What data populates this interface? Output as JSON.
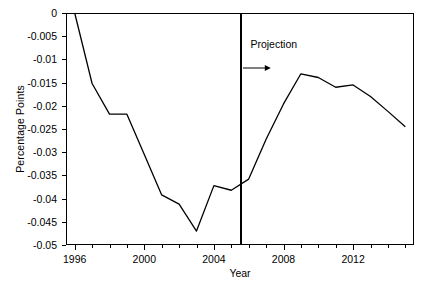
{
  "chart_data": {
    "type": "line",
    "title": "",
    "xlabel": "Year",
    "ylabel": "Percentage Points",
    "xlim": [
      1995.5,
      2015.5
    ],
    "ylim": [
      -0.05,
      0
    ],
    "grid": false,
    "legend": null,
    "x_tick_labels": [
      "1996",
      "2000",
      "2004",
      "2008",
      "2012"
    ],
    "x_tick_values": [
      1996,
      2000,
      2004,
      2008,
      2012
    ],
    "x_minor_ticks": [
      1997,
      1998,
      1999,
      2001,
      2002,
      2003,
      2005,
      2006,
      2007,
      2009,
      2010,
      2011,
      2013,
      2014,
      2015
    ],
    "y_tick_labels": [
      "0",
      "-0.005",
      "-0.01",
      "-0.015",
      "-0.02",
      "-0.025",
      "-0.03",
      "-0.035",
      "-0.04",
      "-0.045",
      "-0.05"
    ],
    "y_tick_values": [
      0,
      -0.005,
      -0.01,
      -0.015,
      -0.02,
      -0.025,
      -0.03,
      -0.035,
      -0.04,
      -0.045,
      -0.05
    ],
    "series": [
      {
        "name": "Percentage point change",
        "color": "#000000",
        "x": [
          1996,
          1997,
          1998,
          1999,
          2000,
          2001,
          2002,
          2003,
          2004,
          2005,
          2006,
          2007,
          2008,
          2009,
          2010,
          2011,
          2012,
          2013,
          2014,
          2015
        ],
        "values": [
          0,
          -0.0152,
          -0.0218,
          -0.0218,
          -0.0305,
          -0.0392,
          -0.0412,
          -0.047,
          -0.0372,
          -0.0382,
          -0.0358,
          -0.0272,
          -0.0196,
          -0.0131,
          -0.0139,
          -0.016,
          -0.0155,
          -0.018,
          -0.0212,
          -0.0245
        ]
      }
    ],
    "annotations": [
      {
        "name": "projection-divider",
        "type": "vline",
        "x": 2005.5,
        "color": "#000000"
      },
      {
        "name": "projection-label",
        "type": "text",
        "text": "Projection",
        "x": 2006.1,
        "y": -0.0068
      },
      {
        "name": "projection-arrow",
        "type": "arrow",
        "x_start": 2005.7,
        "x_end": 2007.3,
        "y": -0.0118
      }
    ]
  }
}
